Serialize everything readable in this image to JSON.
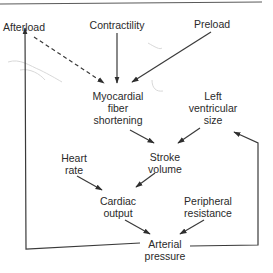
{
  "diagram": {
    "title": "",
    "colors": {
      "line": "#3a3a3a",
      "text": "#2a2a2a",
      "top_rule": "#5a5a5a",
      "pencil_marks": "#d0d0d0",
      "background": "#ffffff"
    },
    "nodes": {
      "afterload": {
        "line1": "Afterload"
      },
      "contractility": {
        "line1": "Contractility"
      },
      "preload": {
        "line1": "Preload"
      },
      "myocardial": {
        "line1": "Myocardial",
        "line2": "fiber",
        "line3": "shortening"
      },
      "lv_size": {
        "line1": "Left",
        "line2": "ventricular",
        "line3": "size"
      },
      "heart_rate": {
        "line1": "Heart",
        "line2": "rate"
      },
      "stroke_volume": {
        "line1": "Stroke",
        "line2": "volume"
      },
      "cardiac_output": {
        "line1": "Cardiac",
        "line2": "output"
      },
      "peripheral_resistance": {
        "line1": "Peripheral",
        "line2": "resistance"
      },
      "arterial_pressure": {
        "line1": "Arterial",
        "line2": "pressure"
      }
    },
    "edges": [
      {
        "from": "Afterload",
        "to": "Myocardial fiber shortening",
        "style": "dashed"
      },
      {
        "from": "Contractility",
        "to": "Myocardial fiber shortening",
        "style": "solid"
      },
      {
        "from": "Preload",
        "to": "Myocardial fiber shortening",
        "style": "solid"
      },
      {
        "from": "Myocardial fiber shortening",
        "to": "Stroke volume",
        "style": "solid"
      },
      {
        "from": "Left ventricular size",
        "to": "Stroke volume",
        "style": "solid"
      },
      {
        "from": "Heart rate",
        "to": "Cardiac output",
        "style": "solid"
      },
      {
        "from": "Stroke volume",
        "to": "Cardiac output",
        "style": "solid"
      },
      {
        "from": "Cardiac output",
        "to": "Arterial pressure",
        "style": "solid"
      },
      {
        "from": "Peripheral resistance",
        "to": "Arterial pressure",
        "style": "solid"
      },
      {
        "from": "Arterial pressure",
        "to": "Afterload",
        "style": "solid",
        "route": "left feedback loop"
      },
      {
        "from": "Arterial pressure",
        "to": "Left ventricular size",
        "style": "solid",
        "route": "right feedback loop"
      }
    ]
  }
}
